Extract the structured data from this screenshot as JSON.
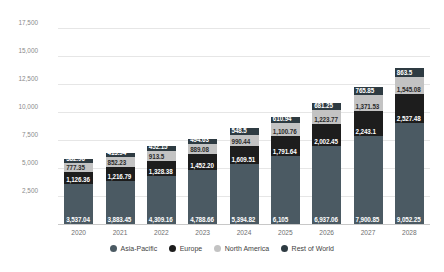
{
  "chart_data": {
    "type": "bar",
    "stacked": true,
    "title": "",
    "subtitle": "",
    "xlabel": "",
    "ylabel": "Market size in million U.S. dollars",
    "ylim": [
      0,
      18500
    ],
    "grid": true,
    "legend_position": "bottom",
    "ytick_labels": [
      "2,500",
      "5,000",
      "7,500",
      "10,000",
      "12,500",
      "15,000",
      "17,500"
    ],
    "ytick_values": [
      2500,
      5000,
      7500,
      10000,
      12500,
      15000,
      17500
    ],
    "categories": [
      "2020",
      "2021",
      "2022",
      "2023",
      "2024",
      "2025",
      "2026",
      "2027",
      "2028"
    ],
    "series": [
      {
        "name": "Asia-Pacific",
        "color": "#4b5a63",
        "values": [
          3537.04,
          3883.45,
          4309.16,
          4788.66,
          5394.82,
          6105,
          6937.06,
          7900.85,
          9052.25
        ],
        "labels": [
          "3,537.04",
          "3,883.45",
          "4,309.16",
          "4,788.66",
          "5,394.82",
          "6,105",
          "6,937.06",
          "7,900.85",
          "9,052.25"
        ]
      },
      {
        "name": "Europe",
        "color": "#1d1d1d",
        "values": [
          1126.36,
          1216.79,
          1328.38,
          1452.2,
          1609.51,
          1791.64,
          2002.45,
          2243.1,
          2527.48
        ],
        "labels": [
          "1,126.36",
          "1,216.79",
          "1,328.38",
          "1,452.20",
          "1,609.51",
          "1,791.64",
          "2,002.45",
          "2,243.1",
          "2,527.48"
        ]
      },
      {
        "name": "North America",
        "color": "#c3c3c3",
        "values": [
          777.35,
          852.23,
          913.5,
          889.08,
          990.44,
          1100.76,
          1223.77,
          1371.53,
          1545.08
        ],
        "labels": [
          "777.35",
          "852.23",
          "913.5",
          "889.08",
          "990.44",
          "1,100.76",
          "1,223.77",
          "1,371.53",
          "1,545.08"
        ]
      },
      {
        "name": "Rest of World",
        "color": "#2e3b42",
        "values": [
          382.96,
          413.94,
          452.15,
          494.63,
          548.5,
          610.94,
          681.25,
          765.85,
          863.5
        ],
        "labels": [
          "382.96",
          "413.94",
          "452.15",
          "494.63",
          "548.5",
          "610.94",
          "681.25",
          "765.85",
          "863.5"
        ]
      }
    ]
  },
  "legend": {
    "items": [
      {
        "label": "Asia-Pacific"
      },
      {
        "label": "Europe"
      },
      {
        "label": "North America"
      },
      {
        "label": "Rest of World"
      }
    ]
  }
}
